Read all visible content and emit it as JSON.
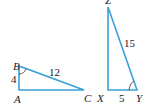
{
  "figure": {
    "stroke_color": "#3aa0d8",
    "triangle_abc": {
      "vertices": {
        "A": "A",
        "B": "B",
        "C": "C"
      },
      "side_ab": "4",
      "side_bc": "12",
      "right_angle_at": "A",
      "marked_angle": "B"
    },
    "triangle_xyz": {
      "vertices": {
        "X": "X",
        "Y": "Y",
        "Z": "Z"
      },
      "side_xy": "5",
      "side_yz": "15",
      "right_angle_at": "X",
      "marked_angle": "Y"
    }
  }
}
